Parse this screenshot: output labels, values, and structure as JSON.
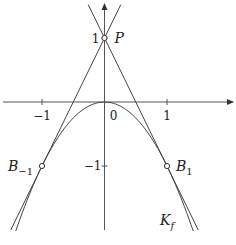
{
  "diagram": {
    "curve": {
      "name": "K_f",
      "equation": "y = -x^2",
      "x_range": [
        -1.42,
        1.42
      ]
    },
    "tangents": [
      {
        "name": "tangent-left",
        "equation": "y = 2x + 1",
        "y_range": [
          -2.0,
          1.52
        ]
      },
      {
        "name": "tangent-right",
        "equation": "y = -2x + 1",
        "y_range": [
          -2.0,
          1.52
        ]
      }
    ],
    "points": [
      {
        "id": "P",
        "label": "P",
        "x": 0,
        "y": 1
      },
      {
        "id": "B_-1",
        "label": "B",
        "sub": "−1",
        "x": -1,
        "y": -1
      },
      {
        "id": "B_1",
        "label": "B",
        "sub": "1",
        "x": 1,
        "y": -1
      }
    ],
    "axes": {
      "x_range": [
        -1.62,
        2.05
      ],
      "y_range": [
        -2.0,
        1.6
      ],
      "x_ticks": [
        {
          "value": -1,
          "label": "−1"
        },
        {
          "value": 1,
          "label": "1"
        }
      ],
      "y_ticks": [
        {
          "value": 1,
          "label": "1"
        },
        {
          "value": -1,
          "label": "−1"
        }
      ],
      "origin_label": "0"
    },
    "curve_label": {
      "text": "K",
      "sub": "f"
    },
    "colors": {
      "line": "#444444",
      "axis": "#555555",
      "text": "#222222"
    }
  }
}
